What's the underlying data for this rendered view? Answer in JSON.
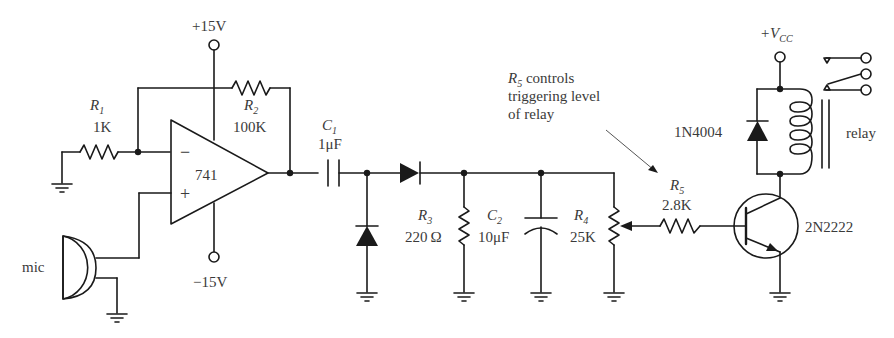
{
  "diagram": {
    "type": "circuit-schematic",
    "colors": {
      "ink": "#1a1a1a",
      "text": "#3a3a3a",
      "background": "#ffffff"
    },
    "labels": {
      "vpos": "+15V",
      "vneg": "−15V",
      "r1_name": "R",
      "r1_sub": "1",
      "r1_value": "1K",
      "r2_name": "R",
      "r2_sub": "2",
      "r2_value": "100K",
      "opamp": "741",
      "opamp_minus": "−",
      "opamp_plus": "+",
      "mic": "mic",
      "c1_name": "C",
      "c1_sub": "1",
      "c1_value": "1μF",
      "r3_name": "R",
      "r3_sub": "3",
      "r3_value": "220 Ω",
      "c2_name": "C",
      "c2_sub": "2",
      "c2_value": "10μF",
      "r4_name": "R",
      "r4_sub": "4",
      "r4_value": "25K",
      "r5_name": "R",
      "r5_sub": "5",
      "r5_value": "2.8K",
      "note_r": "R",
      "note_sub": "5",
      "note_line1": " controls",
      "note_line2": "triggering level",
      "note_line3": "of relay",
      "vcc_plus": "+V",
      "vcc_sub": "CC",
      "diode_flyback": "1N4004",
      "relay": "relay",
      "transistor": "2N2222"
    },
    "components": [
      {
        "ref": "R1",
        "type": "resistor",
        "value": "1K"
      },
      {
        "ref": "R2",
        "type": "resistor",
        "value": "100K"
      },
      {
        "ref": "U1",
        "type": "op-amp",
        "value": "741"
      },
      {
        "ref": "MIC",
        "type": "microphone",
        "value": "mic"
      },
      {
        "ref": "C1",
        "type": "capacitor",
        "value": "1μF"
      },
      {
        "ref": "D1",
        "type": "diode",
        "value": "shunt"
      },
      {
        "ref": "D2",
        "type": "diode",
        "value": "series"
      },
      {
        "ref": "R3",
        "type": "resistor",
        "value": "220Ω"
      },
      {
        "ref": "C2",
        "type": "capacitor-polarized",
        "value": "10μF"
      },
      {
        "ref": "R4",
        "type": "potentiometer",
        "value": "25K"
      },
      {
        "ref": "R5",
        "type": "resistor",
        "value": "2.8K"
      },
      {
        "ref": "D3",
        "type": "diode",
        "value": "1N4004"
      },
      {
        "ref": "Q1",
        "type": "npn-transistor",
        "value": "2N2222"
      },
      {
        "ref": "K1",
        "type": "relay",
        "value": "relay"
      }
    ]
  }
}
